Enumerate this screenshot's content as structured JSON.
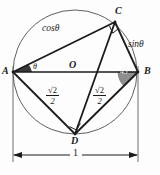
{
  "figure": {
    "background_color": "#fdfdfd",
    "stroke_color": "#1b1b1b",
    "circle_stroke_color": "#5a5a5a",
    "angle_fill_dark": "#3a3a3a",
    "angle_fill_gray": "#8e8e8e"
  },
  "points": {
    "A": {
      "label": "A",
      "x": 13,
      "y": 72
    },
    "B": {
      "label": "B",
      "x": 138,
      "y": 72
    },
    "C": {
      "label": "C",
      "x": 115,
      "y": 22
    },
    "D": {
      "label": "D",
      "x": 75,
      "y": 134
    },
    "O": {
      "label": "O",
      "x": 75,
      "y": 72
    }
  },
  "circle": {
    "center_x": 75,
    "center_y": 72,
    "radius": 62
  },
  "chord_labels": {
    "cos_theta": "cosθ",
    "sin_theta": "sinθ",
    "left_fraction_numerator": "√2",
    "left_fraction_denominator": "2",
    "right_fraction_numerator": "√2",
    "right_fraction_denominator": "2"
  },
  "angles": {
    "theta_at_A": "θ",
    "angle_at_B": "45°"
  },
  "dimension": {
    "value": "1",
    "from_point": "A",
    "to_point": "B"
  },
  "right_angle_marks": [
    {
      "at": "C"
    },
    {
      "at": "D"
    }
  ]
}
